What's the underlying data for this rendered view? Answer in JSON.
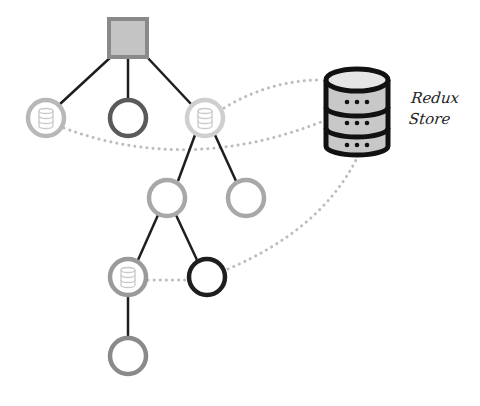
{
  "diagram": {
    "type": "component-tree-with-redux-store",
    "store_label": {
      "line1": "Redux",
      "line2": "Store"
    },
    "colors": {
      "root_fill": "#c4c4c4",
      "root_stroke": "#8a8a8a",
      "edge": "#1e1e1e",
      "dotted_link": "#bdbdbd",
      "node_light": "#b8b8b8",
      "node_lighter": "#cfcfcf",
      "node_medium": "#9a9a9a",
      "node_dark": "#5a5a5a",
      "node_black": "#1e1e1e",
      "store_stroke": "#111111",
      "store_fill": "#c8c8c8",
      "store_top": "#e6e6e6"
    },
    "nodes": [
      {
        "id": "root",
        "shape": "square",
        "x": 128,
        "y": 38,
        "connected_to_store": false
      },
      {
        "id": "l1-left",
        "shape": "circle",
        "x": 46,
        "y": 118,
        "tone": "light",
        "connected_to_store": true
      },
      {
        "id": "l1-middle",
        "shape": "circle",
        "x": 128,
        "y": 118,
        "tone": "dark",
        "connected_to_store": false
      },
      {
        "id": "l1-right",
        "shape": "circle",
        "x": 205,
        "y": 118,
        "tone": "lighter",
        "connected_to_store": true
      },
      {
        "id": "l2-left",
        "shape": "circle",
        "x": 167,
        "y": 198,
        "tone": "light",
        "connected_to_store": false
      },
      {
        "id": "l2-right",
        "shape": "circle",
        "x": 246,
        "y": 198,
        "tone": "light",
        "connected_to_store": false
      },
      {
        "id": "l3-left",
        "shape": "circle",
        "x": 128,
        "y": 277,
        "tone": "medium",
        "connected_to_store": true
      },
      {
        "id": "l3-right",
        "shape": "circle",
        "x": 207,
        "y": 277,
        "tone": "black",
        "connected_to_store": true
      },
      {
        "id": "l4",
        "shape": "circle",
        "x": 128,
        "y": 356,
        "tone": "medium",
        "connected_to_store": false
      }
    ],
    "edges": [
      [
        "root",
        "l1-left"
      ],
      [
        "root",
        "l1-middle"
      ],
      [
        "root",
        "l1-right"
      ],
      [
        "l1-right",
        "l2-left"
      ],
      [
        "l1-right",
        "l2-right"
      ],
      [
        "l2-left",
        "l3-left"
      ],
      [
        "l2-left",
        "l3-right"
      ],
      [
        "l3-left",
        "l4"
      ]
    ],
    "store_links": [
      "l1-left",
      "l1-right",
      "l3-left",
      "l3-right"
    ]
  }
}
